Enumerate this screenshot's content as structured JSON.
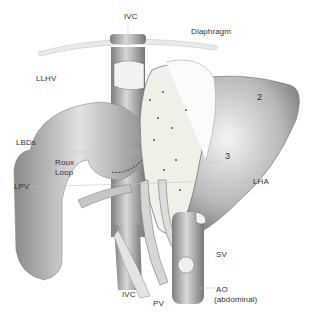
{
  "diagram": {
    "labels": {
      "ivc_top": "IVC",
      "diaphragm": "Diaphragm",
      "llhv": "LLHV",
      "segment2": "2",
      "lbds": "LBDs",
      "roux_loop_1": "Roux",
      "roux_loop_2": "Loop",
      "segment3": "3",
      "lpv": "LPV",
      "lha": "LHA",
      "sv": "SV",
      "ao_1": "AO",
      "ao_2": "(abdominal)",
      "ivc_bottom": "IVC",
      "pv": "PV"
    },
    "colors": {
      "vessel": "#9a9a9a",
      "vessel_light": "#d8d8d8",
      "liver": "#8e8e8e",
      "graft": "#efefe9",
      "label": "#333333",
      "leader": "#bdbdbd"
    }
  }
}
